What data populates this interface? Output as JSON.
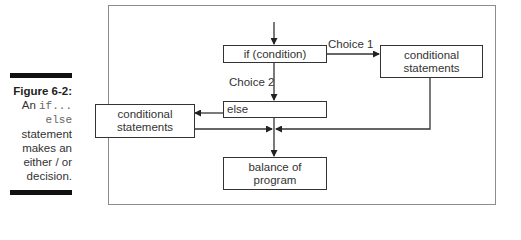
{
  "caption": {
    "figure_label": "Figure 6-2:",
    "line1_prefix": "An ",
    "line1_code": "if...",
    "line2_code": "else",
    "line3": "statement",
    "line4": "makes an",
    "line5": "either / or",
    "line6": "decision."
  },
  "diagram": {
    "nodes": {
      "if_box": "if (condition)",
      "cond_right_line1": "conditional",
      "cond_right_line2": "statements",
      "else_box": "else",
      "cond_left_line1": "conditional",
      "cond_left_line2": "statements",
      "balance_line1": "balance of",
      "balance_line2": "program"
    },
    "edges": {
      "choice1": "Choice 1",
      "choice2": "Choice 2"
    },
    "colors": {
      "line": "#333333",
      "frame": "#8c8c8c",
      "rule": "#111111"
    }
  }
}
